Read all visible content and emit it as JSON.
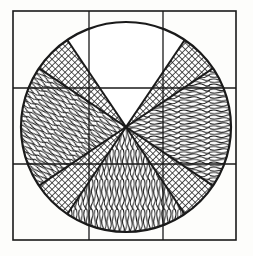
{
  "figure": {
    "type": "technical-line-drawing",
    "caption": "",
    "canvas": {
      "width": 253,
      "height": 256,
      "background": "#fdfdfb"
    },
    "ink_color": "#1a1a1a",
    "frame": {
      "name": "outer-square-frame",
      "x": 13,
      "y": 11,
      "width": 223,
      "height": 229,
      "stroke_width": 1.6
    },
    "grid": {
      "name": "three-by-three-grid",
      "columns": 3,
      "rows": 3,
      "vertical_lines_x": [
        89,
        163
      ],
      "horizontal_lines_y": [
        88,
        164
      ],
      "stroke_width": 1.3
    },
    "circle": {
      "name": "outer-circle",
      "center_x": 126,
      "center_y": 127,
      "radius": 105,
      "stroke_width": 2.2
    },
    "cross": {
      "name": "diagonal-cross-bands",
      "band_half_width_deg": 11,
      "angles_deg": [
        45,
        135,
        225,
        315
      ],
      "stroke_width": 2.0
    },
    "sectors": [
      {
        "id": "sector-top",
        "label": "Top sector",
        "fill": "wavy-horizontal",
        "start_deg": -56,
        "end_deg": -124,
        "hatch_angle_deg": 0
      },
      {
        "id": "sector-upper-right",
        "label": "Upper-right sector",
        "fill": "cross-hatch-dot",
        "start_deg": -56,
        "end_deg": -34,
        "hatch_angle_deg": 45
      },
      {
        "id": "sector-right",
        "label": "Right sector",
        "fill": "wavy-horizontal",
        "start_deg": -34,
        "end_deg": 34,
        "hatch_angle_deg": 0
      },
      {
        "id": "sector-lower-right",
        "label": "Lower-right sector",
        "fill": "cross-hatch-dot",
        "start_deg": 34,
        "end_deg": 56,
        "hatch_angle_deg": 45
      },
      {
        "id": "sector-bottom",
        "label": "Bottom sector",
        "fill": "wavy-vertical",
        "start_deg": 56,
        "end_deg": 124,
        "hatch_angle_deg": 90
      },
      {
        "id": "sector-lower-left",
        "label": "Lower-left sector",
        "fill": "cross-hatch-dot",
        "start_deg": 124,
        "end_deg": 146,
        "hatch_angle_deg": 45
      },
      {
        "id": "sector-left",
        "label": "Left sector",
        "fill": "wavy-diagonal",
        "start_deg": 146,
        "end_deg": 214,
        "hatch_angle_deg": 35
      },
      {
        "id": "sector-upper-left",
        "label": "Upper-left sector",
        "fill": "cross-hatch-dot",
        "start_deg": 214,
        "end_deg": 236,
        "hatch_angle_deg": 45
      }
    ],
    "legend": {
      "wavy_horizontal": "horizontal wood-grain wavy hatching",
      "wavy_vertical": "vertical wood-grain wavy hatching",
      "wavy_diagonal": "diagonal wood-grain wavy hatching",
      "cross_hatch_dot": "fine cross-hatched stipple"
    }
  }
}
